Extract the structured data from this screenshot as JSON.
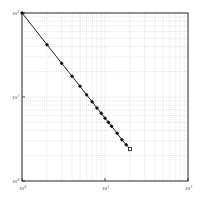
{
  "chart_data": {
    "type": "line",
    "title": "",
    "xlabel": "",
    "ylabel": "",
    "xscale": "log",
    "yscale": "log",
    "xlim": [
      1,
      100
    ],
    "ylim": [
      1,
      100
    ],
    "grid": true,
    "legend": null,
    "x_ticks": [
      {
        "base": "10",
        "exp": "0"
      },
      {
        "base": "10",
        "exp": "1"
      },
      {
        "base": "10",
        "exp": "2"
      }
    ],
    "y_ticks": [
      {
        "base": "10",
        "exp": "0"
      },
      {
        "base": "10",
        "exp": "1"
      },
      {
        "base": "10",
        "exp": "2"
      }
    ],
    "series": [
      {
        "name": "data",
        "marker": "filled-diamond",
        "last_marker": "open-square",
        "line_color": "#222222",
        "x": [
          1,
          2,
          3,
          4,
          5,
          6,
          7,
          8,
          9,
          10,
          11,
          12,
          14,
          16,
          18,
          20
        ],
        "y": [
          100,
          42,
          25.3,
          17.7,
          13.4,
          10.6,
          8.8,
          7.4,
          6.4,
          5.6,
          5.0,
          4.5,
          3.7,
          3.1,
          2.7,
          2.4
        ]
      }
    ]
  },
  "colors": {
    "axis": "#222222",
    "grid": "#bbbbbb",
    "line": "#222222",
    "marker": "#111111"
  }
}
